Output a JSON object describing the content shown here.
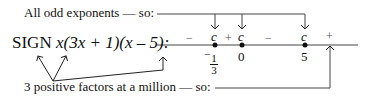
{
  "labels": {
    "top": "All odd exponents — so:",
    "sign_prefix": "SIGN ",
    "expression": "x(3x + 1)(x – 5):",
    "bottom": "3 positive factors at a million — so:"
  },
  "number_line": {
    "critical_marker": "c",
    "points": [
      {
        "value": "-1/3",
        "numerator": "1",
        "denominator": "3",
        "prefix": "−",
        "x": 215
      },
      {
        "value": "0",
        "x": 242
      },
      {
        "value": "5",
        "x": 305
      }
    ],
    "signs": [
      {
        "text": "−",
        "x": 188
      },
      {
        "text": "+",
        "x": 228
      },
      {
        "text": "−",
        "x": 268
      },
      {
        "text": "+",
        "x": 328
      }
    ]
  },
  "colors": {
    "ink": "#111111",
    "line": "#444444",
    "sign_text": "#555555"
  }
}
